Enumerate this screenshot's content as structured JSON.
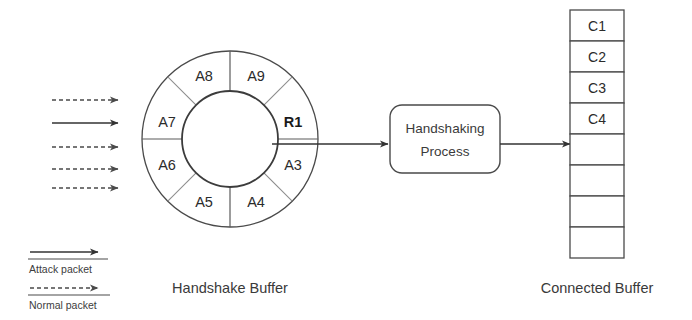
{
  "diagram": {
    "colors": {
      "stroke": "#4a4a4a",
      "text": "#2b2b2b",
      "caption": "#3a3a3a",
      "divider": "#8d8d8d",
      "background": "#ffffff"
    }
  },
  "incoming_packets": [
    {
      "id": "pkt-1",
      "type": "normal",
      "style": "dashed",
      "y": 100
    },
    {
      "id": "pkt-2",
      "type": "attack",
      "style": "solid",
      "y": 123
    },
    {
      "id": "pkt-3",
      "type": "normal",
      "style": "dashed",
      "y": 147
    },
    {
      "id": "pkt-4",
      "type": "normal",
      "style": "dashed",
      "y": 169
    },
    {
      "id": "pkt-5",
      "type": "normal",
      "style": "dashed",
      "y": 188
    }
  ],
  "handshake_buffer": {
    "caption": "Handshake Buffer",
    "center_x": 230,
    "center_y": 139,
    "outer_radius": 88,
    "inner_radius": 48,
    "sectors": [
      {
        "label": "A9",
        "angle": -67.5,
        "current": false
      },
      {
        "label": "R1",
        "angle": -22.5,
        "current": true
      },
      {
        "label": "A3",
        "angle": 22.5,
        "current": false
      },
      {
        "label": "A4",
        "angle": 67.5,
        "current": false
      },
      {
        "label": "A5",
        "angle": 112.5,
        "current": false
      },
      {
        "label": "A6",
        "angle": 157.5,
        "current": false
      },
      {
        "label": "A7",
        "angle": 202.5,
        "current": false
      },
      {
        "label": "A8",
        "angle": 247.5,
        "current": false
      }
    ]
  },
  "handshaking_process": {
    "line1": "Handshaking",
    "line2": "Process",
    "x": 390,
    "y": 105,
    "width": 110,
    "height": 68
  },
  "connected_buffer": {
    "caption": "Connected Buffer",
    "x": 570,
    "y": 10,
    "cell_width": 54,
    "cell_height": 31,
    "cells": [
      {
        "label": "C1"
      },
      {
        "label": "C2"
      },
      {
        "label": "C3"
      },
      {
        "label": "C4"
      },
      {
        "label": ""
      },
      {
        "label": ""
      },
      {
        "label": ""
      },
      {
        "label": ""
      }
    ]
  },
  "legend": {
    "items": [
      {
        "label": "Attack packet",
        "style": "solid"
      },
      {
        "label": "Normal packet",
        "style": "dashed"
      }
    ]
  }
}
